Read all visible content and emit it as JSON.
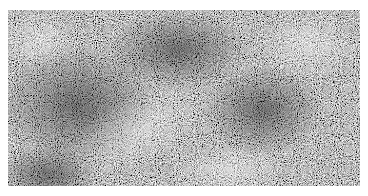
{
  "image": {
    "description": "Grayscale random noise texture with soft darker and lighter blotches",
    "background_color": "#ffffff",
    "panel": {
      "left": 8,
      "top": 10,
      "width": 352,
      "height": 176
    },
    "tones": {
      "base": "#8c8c8c",
      "dark": "#5a5a5a",
      "light": "#c8c8c8"
    }
  }
}
